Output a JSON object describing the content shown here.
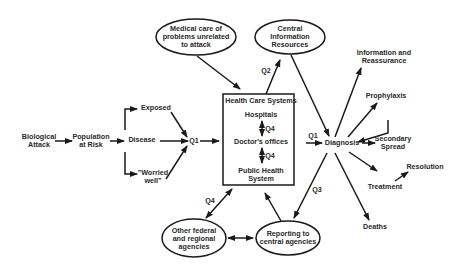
{
  "nodes": {
    "biological_attack": "Biological\nAttack",
    "population_at_risk": "Population\nat Risk",
    "exposed": "Exposed",
    "disease": "Disease",
    "worried_well": "\"Worried\nwell\"",
    "q1_left": "Q1",
    "medical_care": "Medical care of\nproblems unrelated\nto attack",
    "central_info": "Central\nInformation\nResources",
    "health_care_title": "Health Care Systems",
    "hospitals": "Hospitals",
    "doctors_offices": "Doctor's offices",
    "public_health": "Public Health\nSystem",
    "q4_a": "Q4",
    "q4_b": "Q4",
    "q2": "Q2",
    "q1_right": "Q1",
    "diagnosis": "Diagnosis",
    "q3": "Q3",
    "info_reassurance": "Information and\nReassurance",
    "prophylaxis": "Prophylaxis",
    "secondary_spread": "Secondary\nSpread",
    "treatment": "Treatment",
    "resolution": "Resolution",
    "deaths": "Deaths",
    "q4_c": "Q4",
    "other_agencies": "Other federal\nand regional\nagencies",
    "reporting": "Reporting to\ncentral agencies"
  },
  "colors": {
    "stroke": "#1a1a1a",
    "text": "#2a2a2a",
    "background": "#ffffff"
  }
}
